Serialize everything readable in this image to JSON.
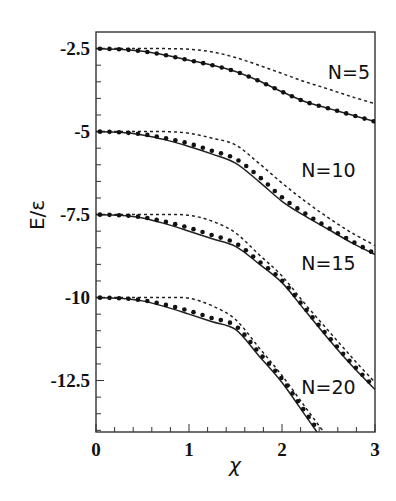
{
  "chart_data": {
    "type": "line",
    "title": "",
    "xlabel": "χ",
    "ylabel": "E/ε",
    "xlim": [
      0,
      3
    ],
    "ylim": [
      -14.05,
      -2.0
    ],
    "grid": false,
    "legend": "none (inline labels N=5, N=10, N=15, N=20)",
    "x_ticks": [
      0,
      1,
      2,
      3
    ],
    "x_tick_labels": [
      "0",
      "1",
      "2",
      "3"
    ],
    "y_ticks": [
      -2.5,
      -5,
      -7.5,
      -10,
      -12.5
    ],
    "y_tick_labels": [
      "-2.5",
      "-5",
      "-7.5",
      "-10",
      "-12.5"
    ],
    "x": [
      0,
      0.25,
      0.5,
      0.75,
      1.0,
      1.25,
      1.5,
      1.75,
      2.0,
      2.25,
      2.5,
      2.75,
      3.0
    ],
    "groups": [
      {
        "label": "N=5",
        "label_pos": [
          2.72,
          -3.2
        ],
        "solid": [
          -2.5,
          -2.52,
          -2.58,
          -2.7,
          -2.85,
          -3.0,
          -3.19,
          -3.47,
          -3.8,
          -4.1,
          -4.3,
          -4.5,
          -4.7
        ],
        "dots": [
          -2.5,
          -2.52,
          -2.58,
          -2.7,
          -2.85,
          -3.0,
          -3.19,
          -3.47,
          -3.8,
          -4.1,
          -4.3,
          -4.5,
          -4.7
        ],
        "dashed": [
          -2.5,
          -2.5,
          -2.5,
          -2.5,
          -2.52,
          -2.6,
          -2.77,
          -3.0,
          -3.25,
          -3.5,
          -3.72,
          -3.95,
          -4.16
        ]
      },
      {
        "label": "N=10",
        "label_pos": [
          2.5,
          -6.15
        ],
        "solid": [
          -5.0,
          -5.02,
          -5.1,
          -5.25,
          -5.45,
          -5.68,
          -5.95,
          -6.5,
          -7.1,
          -7.55,
          -7.95,
          -8.35,
          -8.7
        ],
        "dots": [
          -5.0,
          -5.02,
          -5.08,
          -5.2,
          -5.36,
          -5.58,
          -5.82,
          -6.35,
          -6.98,
          -7.47,
          -7.9,
          -8.3,
          -8.68
        ],
        "dashed": [
          -5.0,
          -5.0,
          -5.0,
          -5.0,
          -5.05,
          -5.2,
          -5.4,
          -5.95,
          -6.55,
          -7.1,
          -7.6,
          -8.05,
          -8.43
        ]
      },
      {
        "label": "N=15",
        "label_pos": [
          2.5,
          -8.95
        ],
        "solid": [
          -7.5,
          -7.52,
          -7.6,
          -7.78,
          -8.0,
          -8.23,
          -8.46,
          -8.98,
          -9.55,
          -10.4,
          -11.25,
          -12.05,
          -12.77
        ],
        "dots": [
          -7.5,
          -7.52,
          -7.58,
          -7.72,
          -7.9,
          -8.12,
          -8.36,
          -8.9,
          -9.48,
          -10.33,
          -11.18,
          -11.98,
          -12.72
        ],
        "dashed": [
          -7.5,
          -7.5,
          -7.5,
          -7.5,
          -7.52,
          -7.7,
          -8.05,
          -8.7,
          -9.35,
          -10.2,
          -11.0,
          -11.8,
          -12.56
        ]
      },
      {
        "label": "N=20",
        "label_pos": [
          2.5,
          -12.7
        ],
        "solid": [
          -10.0,
          -10.02,
          -10.1,
          -10.28,
          -10.5,
          -10.73,
          -10.96,
          -11.75,
          -12.56,
          -13.55,
          null,
          null,
          null
        ],
        "dots": [
          -10.0,
          -10.02,
          -10.08,
          -10.22,
          -10.4,
          -10.62,
          -10.85,
          -11.65,
          -12.45,
          -13.45,
          null,
          null,
          null
        ],
        "dashed": [
          -10.0,
          -10.0,
          -10.0,
          -10.0,
          -10.02,
          -10.25,
          -10.66,
          -11.5,
          -12.35,
          -13.3,
          null,
          null,
          null
        ]
      }
    ]
  }
}
